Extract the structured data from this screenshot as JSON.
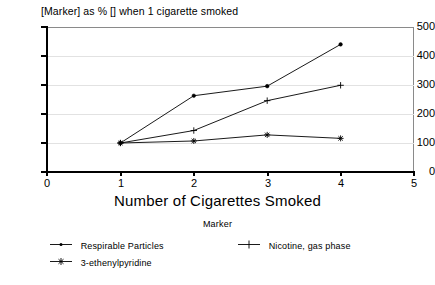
{
  "chart_data": {
    "type": "line",
    "title": "[Marker] as % [] when 1 cigarette smoked",
    "xlabel": "Number of Cigarettes Smoked",
    "ylabel": "",
    "x": [
      1,
      2,
      3,
      4
    ],
    "xlim": [
      0,
      5
    ],
    "ylim": [
      0,
      500
    ],
    "xticks": [
      "0",
      "1",
      "2",
      "3",
      "4",
      "5"
    ],
    "yticks": [
      "0",
      "100",
      "200",
      "300",
      "400",
      "500"
    ],
    "grid": "horizontal",
    "legend_position": "bottom",
    "legend_title": "Marker",
    "series": [
      {
        "name": "Respirable Particles",
        "marker": "dot",
        "color": "#000000",
        "values": [
          100,
          263,
          296,
          440
        ]
      },
      {
        "name": "Nicotine, gas phase",
        "marker": "plus",
        "color": "#000000",
        "values": [
          100,
          143,
          246,
          299
        ]
      },
      {
        "name": "3-ethenylpyridine",
        "marker": "asterisk",
        "color": "#000000",
        "values": [
          100,
          107,
          128,
          116
        ]
      }
    ]
  }
}
